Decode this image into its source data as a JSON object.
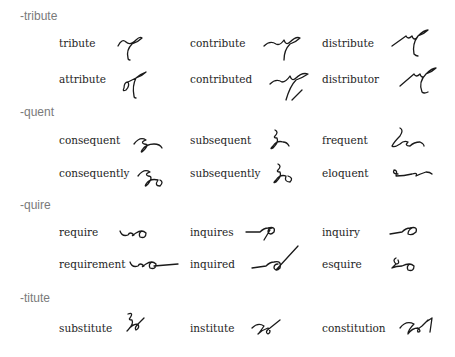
{
  "sections": [
    {
      "title": "-tribute",
      "entries": [
        {
          "word": "tribute",
          "outline": "tribute-outline"
        },
        {
          "word": "contribute",
          "outline": "contribute-outline"
        },
        {
          "word": "distribute",
          "outline": "distribute-outline"
        },
        {
          "word": "attribute",
          "outline": "attribute-outline"
        },
        {
          "word": "contributed",
          "outline": "contributed-outline"
        },
        {
          "word": "distributor",
          "outline": "distributor-outline"
        }
      ]
    },
    {
      "title": "-quent",
      "entries": [
        {
          "word": "consequent",
          "outline": "consequent-outline"
        },
        {
          "word": "subsequent",
          "outline": "subsequent-outline"
        },
        {
          "word": "frequent",
          "outline": "frequent-outline"
        },
        {
          "word": "consequently",
          "outline": "consequently-outline"
        },
        {
          "word": "subsequently",
          "outline": "subsequently-outline"
        },
        {
          "word": "eloquent",
          "outline": "eloquent-outline"
        }
      ]
    },
    {
      "title": "-quire",
      "entries": [
        {
          "word": "require",
          "outline": "require-outline"
        },
        {
          "word": "inquires",
          "outline": "inquires-outline"
        },
        {
          "word": "inquiry",
          "outline": "inquiry-outline"
        },
        {
          "word": "requirement",
          "outline": "requirement-outline"
        },
        {
          "word": "inquired",
          "outline": "inquired-outline"
        },
        {
          "word": "esquire",
          "outline": "esquire-outline"
        }
      ]
    },
    {
      "title": "-titute",
      "entries": [
        {
          "word": "substitute",
          "outline": "substitute-outline"
        },
        {
          "word": "institute",
          "outline": "institute-outline"
        },
        {
          "word": "constitution",
          "outline": "constitution-outline"
        }
      ]
    }
  ]
}
